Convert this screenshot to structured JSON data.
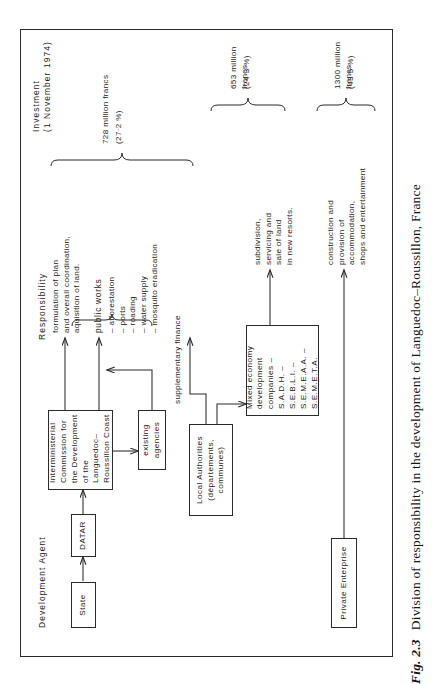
{
  "figure": {
    "number": "Fig. 2.3",
    "caption": "Division of responsibility in the development of Languedoc–Roussillon, France"
  },
  "columns": {
    "agent": "Development  Agent",
    "responsibility": "Responsibility",
    "investment": "Investment\n(1 November 1974)"
  },
  "nodes": {
    "state": "State",
    "datar": "DATAR",
    "commission": "Interministerial  Commission\nfor the Development of the\nLanguedoc–Roussillon Coast",
    "existing_agencies": "existing\nagencies",
    "local_authorities": "Local Authorities\n(départements, communes)",
    "mixed_economy": "Mixed economy\ndevelopment\ncompanies\n– S.A.D.H.\n– S.E.B.L.I.\n– S.E.M.E.A.A.\n– S.E.M.E.T.A.",
    "private_enterprise": "Private  Enterprise"
  },
  "edges": {
    "supplementary_finance": "supplementary  finance"
  },
  "responsibilities": {
    "planning": "formulation of plan\nand overall coordination,\naquisition of land.",
    "public_works_title": "public  works",
    "public_works_items": "– afforestation\n– ports\n– roading\n– water supply\n– mosquito eradication",
    "subdivision": "subdivision,\nservicing and\nsale of land\nin new resorts.",
    "construction": "construction and\nprovision of\naccommodation,\nshops and entertainment"
  },
  "investments": [
    {
      "amount": "728 million francs",
      "share": "(27·2 %)"
    },
    {
      "amount": "653 million francs",
      "share": "(24·3 %)"
    },
    {
      "amount": "1300 million francs",
      "share": "(43·5 %)"
    }
  ],
  "colors": {
    "ink": "#2b2b2b",
    "paper": "#ffffff"
  }
}
